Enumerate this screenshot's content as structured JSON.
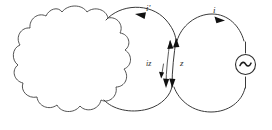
{
  "diagram": {
    "kind": "circuit-diagram",
    "title": "",
    "background_color": "#ffffff",
    "line_color": "#3a3a3a",
    "label_color": "#2b2b2b"
  },
  "labels": {
    "left_loop_current": "i'",
    "right_loop_current": "i",
    "branch_current": "iz",
    "branch_impedance": "z"
  },
  "components": {
    "network_blob": {
      "name": "cloud-network",
      "label": ""
    },
    "ac_source": {
      "name": "ac-source",
      "symbol": "~"
    }
  },
  "loops": [
    {
      "name": "middle-loop",
      "current_label": "i'",
      "arrow_direction": "counterclockwise"
    },
    {
      "name": "right-loop",
      "current_label": "i",
      "arrow_direction": "clockwise"
    }
  ],
  "branch": {
    "name": "shared-branch",
    "impedance_label": "z",
    "current_label": "iz",
    "arrow_top_direction": "up",
    "arrow_bottom_direction": "down"
  }
}
